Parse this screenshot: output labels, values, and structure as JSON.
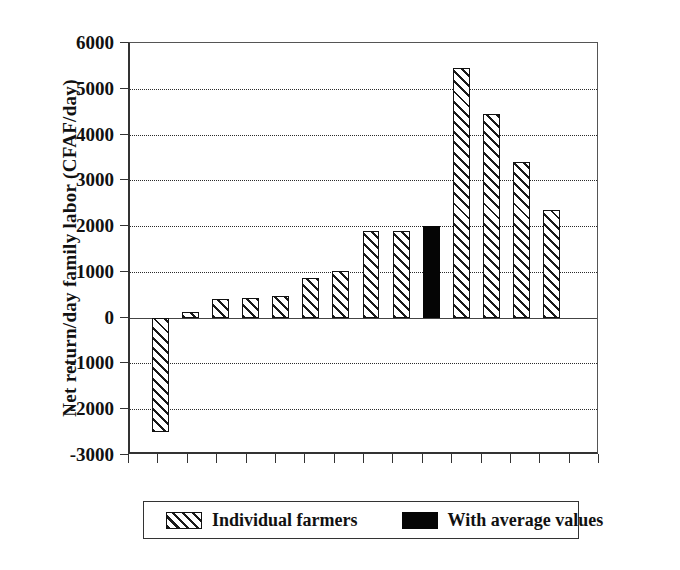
{
  "chart_data": {
    "type": "bar",
    "title": "",
    "xlabel": "",
    "ylabel": "Net return/day family labor (CFAF/day)",
    "ylim": [
      -3000,
      6000
    ],
    "ytick_step": 1000,
    "yticks": [
      "6000",
      "5000",
      "4000",
      "3000",
      "2000",
      "1000",
      "0",
      "-1000",
      "-2000",
      "-3000"
    ],
    "ytick_values": [
      6000,
      5000,
      4000,
      3000,
      2000,
      1000,
      0,
      -1000,
      -2000,
      -3000
    ],
    "grid": "horizontal-dotted",
    "xtick_count": 16,
    "xtick_labels": [],
    "legend_position": "below-plot",
    "categories": [
      "farmer 1",
      "farmer 2",
      "farmer 3",
      "farmer 4",
      "farmer 5",
      "farmer 6",
      "farmer 7",
      "farmer 8",
      "farmer 9",
      "average",
      "farmer 10",
      "farmer 11",
      "farmer 12",
      "farmer 13"
    ],
    "values": [
      -2500,
      130,
      400,
      420,
      470,
      870,
      1010,
      1900,
      1900,
      2000,
      5450,
      4450,
      3400,
      2350
    ],
    "series_of_bar": [
      "individual",
      "individual",
      "individual",
      "individual",
      "individual",
      "individual",
      "individual",
      "individual",
      "individual",
      "average",
      "individual",
      "individual",
      "individual",
      "individual"
    ],
    "series": [
      {
        "name": "Individual farmers",
        "style": "hatched",
        "color": "#1a1a1a"
      },
      {
        "name": "With average values",
        "style": "solid",
        "color": "#050505"
      }
    ]
  },
  "legend": {
    "individual_label": "Individual farmers",
    "average_label": "With average values"
  },
  "colors": {
    "axis": "#333333",
    "grid": "#2b2b2b",
    "hatch": "#1a1a1a",
    "solid": "#050505",
    "background": "#ffffff"
  }
}
